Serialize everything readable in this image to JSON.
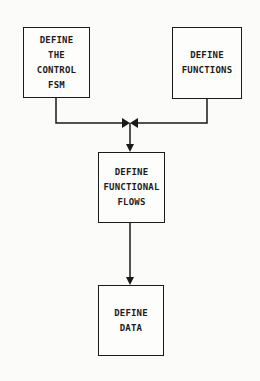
{
  "diagram": {
    "nodes": [
      {
        "id": "control-fsm",
        "label": "DEFINE\nTHE\nCONTROL\nFSM"
      },
      {
        "id": "functions",
        "label": "DEFINE\nFUNCTIONS"
      },
      {
        "id": "functional-flows",
        "label": "DEFINE\nFUNCTIONAL\nFLOWS"
      },
      {
        "id": "data",
        "label": "DEFINE\nDATA"
      }
    ],
    "edges": [
      {
        "from": "control-fsm",
        "to": "functional-flows"
      },
      {
        "from": "functions",
        "to": "functional-flows"
      },
      {
        "from": "functional-flows",
        "to": "data"
      }
    ],
    "colors": {
      "line": "#1a1a1a",
      "background": "#fbfbf9"
    }
  }
}
